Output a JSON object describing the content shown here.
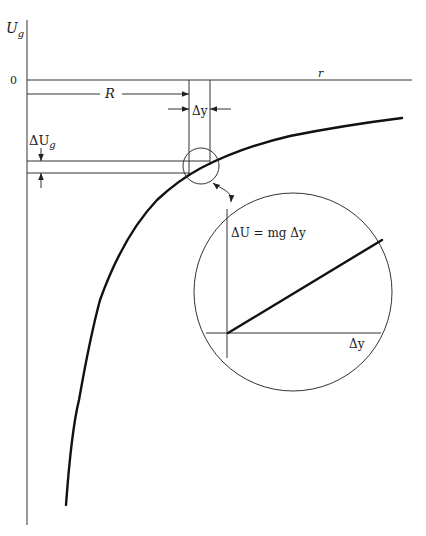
{
  "diagram": {
    "axes": {
      "y_label_main": "U",
      "y_label_sub": "g",
      "x_label": "r",
      "origin_label": "0"
    },
    "annotations": {
      "R_label": "R",
      "delta_y_label": "Δy",
      "delta_Ug_main": "ΔU",
      "delta_Ug_sub": "g",
      "inset_equation": "ΔU = mg Δy",
      "inset_x_label": "Δy"
    },
    "colors": {
      "ink": "#111111",
      "background": "#ffffff"
    }
  }
}
